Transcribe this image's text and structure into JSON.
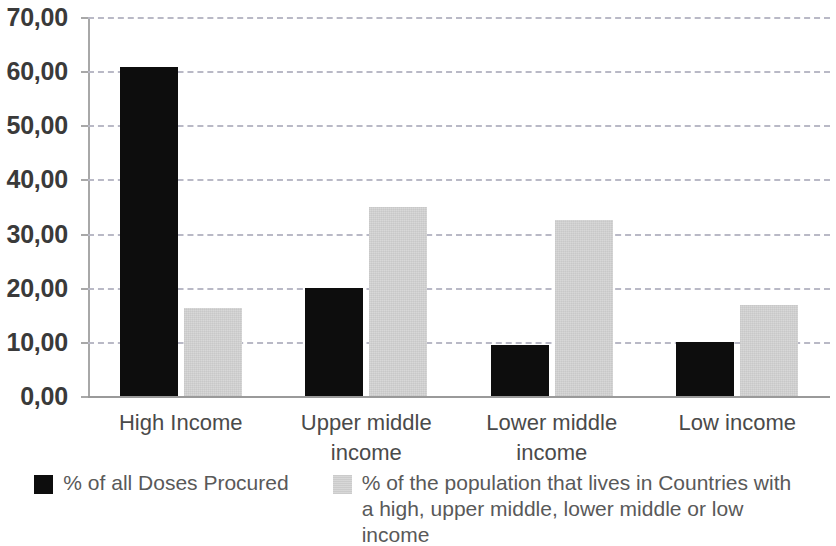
{
  "chart_data": {
    "type": "bar",
    "title": "",
    "subtitle": "",
    "xlabel": "",
    "ylabel": "",
    "ylim": [
      0,
      70
    ],
    "ytick_step": 10,
    "grid": true,
    "grid_style": "dashed horizontal",
    "legend_position": "bottom",
    "decimal_separator": ",",
    "categories": [
      "High Income",
      "Upper middle income",
      "Lower middle income",
      "Low income"
    ],
    "ytick_labels": [
      "70,00",
      "60,00",
      "50,00",
      "40,00",
      "30,00",
      "20,00",
      "10,00",
      "0,00"
    ],
    "ytick_values": [
      70,
      60,
      50,
      40,
      30,
      20,
      10,
      0
    ],
    "series": [
      {
        "name": "% of all Doses Procured",
        "key": "procured",
        "color": "#0d0d0d",
        "values": [
          60.8,
          20.0,
          9.5,
          10.0
        ]
      },
      {
        "name": "% of the population that lives in Countries with a high, upper middle, lower middle or low income",
        "key": "population",
        "color": "#d6d6d6",
        "values": [
          16.2,
          35.0,
          32.5,
          16.8
        ]
      }
    ]
  },
  "legend": {
    "items": [
      {
        "label": "% of all Doses Procured"
      },
      {
        "label": "% of the population that lives in Countries with a high, upper middle, lower middle or low income"
      }
    ]
  },
  "colors": {
    "series_procured": "#0d0d0d",
    "series_population": "#d6d6d6",
    "gridline": "#b9b9c6",
    "axis": "#a8a8a8",
    "tick_text": "#3a3a3a",
    "category_text": "#4a4a4a",
    "legend_text": "#595959",
    "background": "#ffffff"
  }
}
